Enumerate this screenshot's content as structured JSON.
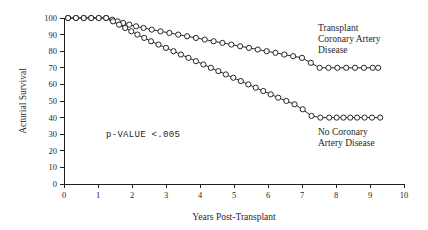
{
  "chart_data": {
    "type": "line",
    "title": "",
    "xlabel": "Years Post-Transplant",
    "ylabel": "Acturial Survival",
    "xlim": [
      0,
      10
    ],
    "ylim": [
      0,
      100
    ],
    "xticks": [
      0,
      1,
      2,
      3,
      4,
      5,
      6,
      7,
      8,
      9,
      10
    ],
    "xtick_labels": [
      "0",
      "1",
      "2",
      "3",
      "4",
      "5",
      "6",
      "7",
      "8",
      "9",
      "10"
    ],
    "yticks": [
      0,
      10,
      20,
      30,
      40,
      50,
      60,
      70,
      80,
      90,
      100
    ],
    "ytick_labels": [
      "0",
      "10",
      "20",
      "30",
      "40",
      "50",
      "60",
      "70",
      "80",
      "90",
      "100"
    ],
    "grid": false,
    "legend_position": "inline-annotation",
    "marker": "open-circle",
    "series": [
      {
        "name": "Transplant Coronary Artery Disease",
        "label_lines": [
          "Transplant",
          "Coronary Artery",
          "Disease"
        ],
        "x": [
          0.12,
          0.35,
          0.58,
          0.8,
          1.02,
          1.24,
          1.42,
          1.58,
          1.74,
          1.92,
          2.12,
          2.34,
          2.58,
          2.84,
          3.1,
          3.36,
          3.62,
          3.88,
          4.14,
          4.4,
          4.66,
          4.92,
          5.18,
          5.44,
          5.7,
          5.96,
          6.22,
          6.48,
          6.74,
          7.0,
          7.26,
          7.52,
          7.78,
          8.04,
          8.3,
          8.56,
          8.82,
          9.08,
          9.24
        ],
        "y": [
          100,
          100,
          100,
          100,
          100,
          100,
          99,
          98,
          97,
          96,
          95,
          94,
          93,
          92,
          91,
          90,
          89,
          88,
          87,
          86,
          85,
          84,
          83,
          82,
          81,
          80,
          79,
          78,
          77,
          76,
          73,
          70,
          70,
          70,
          70,
          70,
          70,
          70,
          70
        ]
      },
      {
        "name": "No Coronary Artery Disease",
        "label_lines": [
          "No Coronary",
          "Artery Disease"
        ],
        "x": [
          0.12,
          0.35,
          0.58,
          0.8,
          1.02,
          1.24,
          1.44,
          1.62,
          1.8,
          1.98,
          2.16,
          2.36,
          2.56,
          2.78,
          3.0,
          3.22,
          3.44,
          3.66,
          3.88,
          4.1,
          4.32,
          4.54,
          4.76,
          4.98,
          5.2,
          5.42,
          5.64,
          5.86,
          6.08,
          6.3,
          6.54,
          6.78,
          7.02,
          7.28,
          7.54,
          7.8,
          8.02,
          8.22,
          8.42,
          8.62,
          8.84,
          9.06,
          9.3
        ],
        "y": [
          100,
          100,
          100,
          100,
          100,
          100,
          98,
          96,
          94,
          92,
          90,
          88,
          86,
          84,
          82,
          80,
          78,
          76,
          74,
          72,
          70,
          68,
          66,
          64,
          62,
          60,
          58,
          56,
          54,
          52,
          50,
          48,
          45,
          41,
          40,
          40,
          40,
          40,
          40,
          40,
          40,
          40,
          40
        ]
      }
    ],
    "annotations": [
      {
        "name": "p-value",
        "text": "p-VALUE <.005",
        "x": 2.0,
        "y": 28
      }
    ]
  }
}
